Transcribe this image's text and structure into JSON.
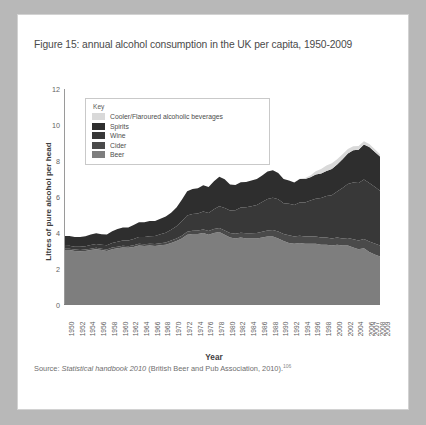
{
  "figure": {
    "title": "Figure 15: annual alcohol consumption in the UK per capita, 1950-2009",
    "source_prefix": "Source: ",
    "source_italic": "Statistical handbook 2010",
    "source_rest": " (British Beer and Pub Association, 2010).",
    "source_ref": "106"
  },
  "legend": {
    "title": "Key",
    "items": [
      {
        "label": "Cooler/Flaroured alcoholic beverages",
        "color": "#d9d9d9"
      },
      {
        "label": "Spirits",
        "color": "#2e2e2e"
      },
      {
        "label": "Wine",
        "color": "#383838"
      },
      {
        "label": "Cider",
        "color": "#4a4a4a"
      },
      {
        "label": "Beer",
        "color": "#7e7e7e"
      }
    ]
  },
  "chart_data": {
    "type": "area",
    "stacked": true,
    "title": "annual alcohol consumption in the UK per capita, 1950-2009",
    "xlabel": "Year",
    "ylabel": "Litres of pure alcohol per head",
    "ylim": [
      0,
      12
    ],
    "yticks": [
      0,
      2,
      4,
      6,
      8,
      10,
      12
    ],
    "grid": false,
    "legend_position": "inside-top-left",
    "x": [
      1950,
      1951,
      1952,
      1953,
      1954,
      1955,
      1956,
      1957,
      1958,
      1959,
      1960,
      1961,
      1962,
      1963,
      1964,
      1965,
      1966,
      1967,
      1968,
      1969,
      1970,
      1971,
      1972,
      1973,
      1974,
      1975,
      1976,
      1977,
      1978,
      1979,
      1980,
      1981,
      1982,
      1983,
      1984,
      1985,
      1986,
      1987,
      1988,
      1989,
      1990,
      1991,
      1992,
      1993,
      1994,
      1995,
      1996,
      1997,
      1998,
      1999,
      2000,
      2001,
      2002,
      2003,
      2004,
      2005,
      2006,
      2007,
      2008,
      2009
    ],
    "xtick_labels": [
      "1950",
      "1952",
      "1954",
      "1956",
      "1958",
      "1960",
      "1962",
      "1964",
      "1966",
      "1968",
      "1970",
      "1972",
      "1974",
      "1976",
      "1978",
      "1980",
      "1982",
      "1984",
      "1986",
      "1988",
      "1990",
      "1992",
      "1994",
      "1996",
      "1998",
      "2000",
      "2002",
      "2004",
      "2006",
      "2007",
      "2008",
      "2009"
    ],
    "series": [
      {
        "name": "Beer",
        "color": "#7e7e7e",
        "values": [
          3.05,
          3.05,
          3.0,
          2.98,
          3.0,
          3.05,
          3.1,
          3.05,
          3.0,
          3.1,
          3.15,
          3.2,
          3.18,
          3.22,
          3.3,
          3.28,
          3.3,
          3.28,
          3.32,
          3.35,
          3.45,
          3.55,
          3.7,
          3.9,
          3.95,
          3.95,
          4.0,
          3.9,
          4.0,
          4.05,
          3.9,
          3.75,
          3.7,
          3.75,
          3.7,
          3.7,
          3.7,
          3.75,
          3.8,
          3.8,
          3.7,
          3.55,
          3.45,
          3.4,
          3.45,
          3.4,
          3.4,
          3.4,
          3.35,
          3.35,
          3.3,
          3.35,
          3.3,
          3.3,
          3.2,
          3.1,
          3.15,
          2.95,
          2.8,
          2.7
        ]
      },
      {
        "name": "Cider",
        "color": "#4a4a4a",
        "values": [
          0.08,
          0.08,
          0.08,
          0.08,
          0.08,
          0.08,
          0.08,
          0.08,
          0.08,
          0.09,
          0.09,
          0.09,
          0.09,
          0.1,
          0.1,
          0.1,
          0.1,
          0.11,
          0.11,
          0.12,
          0.13,
          0.14,
          0.15,
          0.17,
          0.18,
          0.19,
          0.2,
          0.21,
          0.22,
          0.23,
          0.24,
          0.25,
          0.26,
          0.27,
          0.28,
          0.29,
          0.3,
          0.32,
          0.34,
          0.36,
          0.38,
          0.4,
          0.42,
          0.4,
          0.4,
          0.4,
          0.4,
          0.4,
          0.4,
          0.4,
          0.4,
          0.4,
          0.4,
          0.42,
          0.45,
          0.48,
          0.52,
          0.58,
          0.62,
          0.6
        ]
      },
      {
        "name": "Wine",
        "color": "#383838",
        "values": [
          0.15,
          0.16,
          0.16,
          0.17,
          0.18,
          0.2,
          0.21,
          0.22,
          0.24,
          0.26,
          0.28,
          0.3,
          0.32,
          0.35,
          0.38,
          0.4,
          0.42,
          0.45,
          0.5,
          0.55,
          0.6,
          0.68,
          0.8,
          0.9,
          0.92,
          0.95,
          1.0,
          1.0,
          1.1,
          1.2,
          1.25,
          1.25,
          1.3,
          1.4,
          1.45,
          1.5,
          1.55,
          1.65,
          1.75,
          1.8,
          1.8,
          1.7,
          1.75,
          1.75,
          1.85,
          1.9,
          2.0,
          2.1,
          2.2,
          2.3,
          2.4,
          2.55,
          2.8,
          3.0,
          3.15,
          3.2,
          3.3,
          3.25,
          3.15,
          3.05
        ]
      },
      {
        "name": "Spirits",
        "color": "#2e2e2e",
        "values": [
          0.55,
          0.55,
          0.54,
          0.55,
          0.56,
          0.58,
          0.6,
          0.58,
          0.6,
          0.65,
          0.7,
          0.72,
          0.72,
          0.78,
          0.82,
          0.82,
          0.84,
          0.82,
          0.86,
          0.9,
          0.95,
          1.05,
          1.2,
          1.35,
          1.4,
          1.4,
          1.45,
          1.45,
          1.55,
          1.65,
          1.6,
          1.45,
          1.4,
          1.4,
          1.4,
          1.42,
          1.45,
          1.48,
          1.52,
          1.52,
          1.45,
          1.35,
          1.3,
          1.25,
          1.3,
          1.3,
          1.3,
          1.35,
          1.35,
          1.4,
          1.45,
          1.5,
          1.6,
          1.7,
          1.8,
          1.85,
          1.95,
          2.0,
          1.95,
          1.9
        ]
      },
      {
        "name": "Cooler/Flaroured alcoholic beverages",
        "color": "#d9d9d9",
        "values": [
          0,
          0,
          0,
          0,
          0,
          0,
          0,
          0,
          0,
          0,
          0,
          0,
          0,
          0,
          0,
          0,
          0,
          0,
          0,
          0,
          0,
          0,
          0,
          0,
          0,
          0,
          0,
          0,
          0,
          0,
          0,
          0,
          0,
          0,
          0,
          0,
          0,
          0,
          0,
          0,
          0,
          0,
          0,
          0,
          0.02,
          0.05,
          0.1,
          0.18,
          0.25,
          0.3,
          0.32,
          0.3,
          0.28,
          0.25,
          0.22,
          0.2,
          0.18,
          0.16,
          0.14,
          0.12
        ]
      }
    ]
  }
}
